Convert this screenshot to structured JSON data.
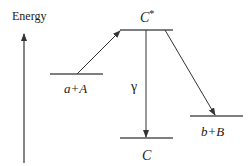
{
  "diagram": {
    "axis": {
      "label": "Energy"
    },
    "levels": {
      "entrance": {
        "label": "a+A"
      },
      "compound": {
        "label": "C*"
      },
      "ground": {
        "label": "C"
      },
      "exit": {
        "label": "b+B"
      }
    },
    "transitions": {
      "gamma": {
        "label": "γ"
      }
    },
    "colors": {
      "line": "#333333"
    }
  }
}
